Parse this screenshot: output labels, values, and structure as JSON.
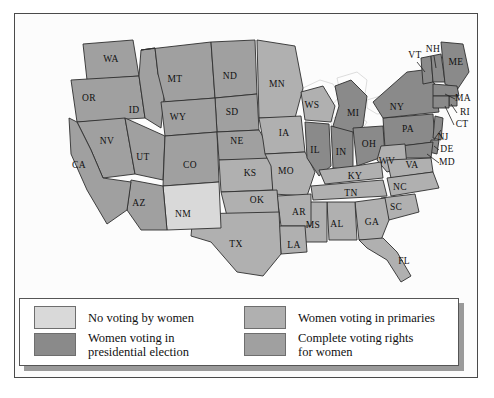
{
  "figure": {
    "background": "#ffffff",
    "frame_color": "#4a4a4a"
  },
  "palette": {
    "no_voting": "#d9d9d9",
    "presidential": "#8a8a8a",
    "primaries": "#b0b0b0",
    "complete": "#a0a0a0",
    "water": "#fdfdfd",
    "border": "#2f2f2f",
    "label": "#111111"
  },
  "legend": {
    "items": [
      {
        "id": "no-voting",
        "label": "No voting by women",
        "color": "#d9d9d9"
      },
      {
        "id": "primaries",
        "label": "Women voting in primaries",
        "color": "#b0b0b0"
      },
      {
        "id": "presidential",
        "label": "Women voting in\npresidential election",
        "color": "#8a8a8a"
      },
      {
        "id": "complete",
        "label": "Complete voting rights\nfor women",
        "color": "#a0a0a0"
      }
    ]
  },
  "chart_data": {
    "type": "map",
    "legend_position": "bottom",
    "categories": [
      "No voting by women",
      "Women voting in presidential election",
      "Women voting in primaries",
      "Complete voting rights for women"
    ],
    "category_colors": {
      "No voting by women": "#d9d9d9",
      "Women voting in presidential election": "#8a8a8a",
      "Women voting in primaries": "#b0b0b0",
      "Complete voting rights for women": "#a0a0a0"
    },
    "states": [
      {
        "code": "WA",
        "category": "Complete voting rights for women",
        "lx": 96,
        "ly": 46
      },
      {
        "code": "OR",
        "category": "Complete voting rights for women",
        "lx": 74,
        "ly": 85
      },
      {
        "code": "ID",
        "category": "Complete voting rights for women",
        "lx": 119,
        "ly": 97
      },
      {
        "code": "MT",
        "category": "Complete voting rights for women",
        "lx": 160,
        "ly": 66
      },
      {
        "code": "ND",
        "category": "Complete voting rights for women",
        "lx": 215,
        "ly": 63
      },
      {
        "code": "SD",
        "category": "Complete voting rights for women",
        "lx": 217,
        "ly": 99
      },
      {
        "code": "MN",
        "category": "Women voting in primaries",
        "lx": 262,
        "ly": 71
      },
      {
        "code": "WS",
        "category": "Women voting in primaries",
        "lx": 297,
        "ly": 92
      },
      {
        "code": "MI",
        "category": "Women voting in presidential election",
        "lx": 338,
        "ly": 100
      },
      {
        "code": "NY",
        "category": "Women voting in presidential election",
        "lx": 382,
        "ly": 94
      },
      {
        "code": "VT",
        "category": "Women voting in presidential election",
        "lx": 400,
        "ly": 42
      },
      {
        "code": "NH",
        "category": "Women voting in presidential election",
        "lx": 418,
        "ly": 36
      },
      {
        "code": "ME",
        "category": "Women voting in presidential election",
        "lx": 441,
        "ly": 49
      },
      {
        "code": "MA",
        "category": "Women voting in presidential election",
        "lx": 448,
        "ly": 85
      },
      {
        "code": "RI",
        "category": "Women voting in presidential election",
        "lx": 450,
        "ly": 99
      },
      {
        "code": "CT",
        "category": "Women voting in presidential election",
        "lx": 447,
        "ly": 111
      },
      {
        "code": "PA",
        "category": "Women voting in presidential election",
        "lx": 393,
        "ly": 116
      },
      {
        "code": "NJ",
        "category": "Women voting in presidential election",
        "lx": 428,
        "ly": 124
      },
      {
        "code": "DE",
        "category": "Women voting in presidential election",
        "lx": 432,
        "ly": 136
      },
      {
        "code": "MD",
        "category": "Women voting in presidential election",
        "lx": 432,
        "ly": 149
      },
      {
        "code": "WY",
        "category": "Complete voting rights for women",
        "lx": 163,
        "ly": 104
      },
      {
        "code": "NV",
        "category": "Complete voting rights for women",
        "lx": 92,
        "ly": 128
      },
      {
        "code": "UT",
        "category": "Complete voting rights for women",
        "lx": 128,
        "ly": 144
      },
      {
        "code": "CO",
        "category": "Complete voting rights for women",
        "lx": 175,
        "ly": 152
      },
      {
        "code": "NE",
        "category": "Complete voting rights for women",
        "lx": 222,
        "ly": 128
      },
      {
        "code": "IA",
        "category": "Women voting in primaries",
        "lx": 269,
        "ly": 120
      },
      {
        "code": "IL",
        "category": "Women voting in presidential election",
        "lx": 300,
        "ly": 137
      },
      {
        "code": "IN",
        "category": "Women voting in presidential election",
        "lx": 326,
        "ly": 139
      },
      {
        "code": "OH",
        "category": "Women voting in presidential election",
        "lx": 354,
        "ly": 131
      },
      {
        "code": "WV",
        "category": "Women voting in primaries",
        "lx": 372,
        "ly": 148
      },
      {
        "code": "VA",
        "category": "Women voting in primaries",
        "lx": 397,
        "ly": 152
      },
      {
        "code": "KY",
        "category": "Women voting in primaries",
        "lx": 340,
        "ly": 163
      },
      {
        "code": "MO",
        "category": "Women voting in primaries",
        "lx": 271,
        "ly": 158
      },
      {
        "code": "KS",
        "category": "Women voting in primaries",
        "lx": 235,
        "ly": 160
      },
      {
        "code": "CA",
        "category": "Complete voting rights for women",
        "lx": 64,
        "ly": 152
      },
      {
        "code": "AZ",
        "category": "Complete voting rights for women",
        "lx": 124,
        "ly": 190
      },
      {
        "code": "NM",
        "category": "No voting by women",
        "lx": 168,
        "ly": 201
      },
      {
        "code": "OK",
        "category": "Women voting in primaries",
        "lx": 242,
        "ly": 187
      },
      {
        "code": "AR",
        "category": "Women voting in primaries",
        "lx": 284,
        "ly": 199
      },
      {
        "code": "TN",
        "category": "Women voting in primaries",
        "lx": 336,
        "ly": 180
      },
      {
        "code": "NC",
        "category": "Women voting in primaries",
        "lx": 385,
        "ly": 174
      },
      {
        "code": "SC",
        "category": "Women voting in primaries",
        "lx": 381,
        "ly": 194
      },
      {
        "code": "GA",
        "category": "Women voting in primaries",
        "lx": 357,
        "ly": 209
      },
      {
        "code": "AL",
        "category": "Women voting in primaries",
        "lx": 322,
        "ly": 211
      },
      {
        "code": "MS",
        "category": "Women voting in primaries",
        "lx": 298,
        "ly": 212
      },
      {
        "code": "LA",
        "category": "Women voting in primaries",
        "lx": 279,
        "ly": 232
      },
      {
        "code": "TX",
        "category": "Women voting in primaries",
        "lx": 221,
        "ly": 231
      },
      {
        "code": "FL",
        "category": "Women voting in primaries",
        "lx": 389,
        "ly": 248
      }
    ]
  }
}
